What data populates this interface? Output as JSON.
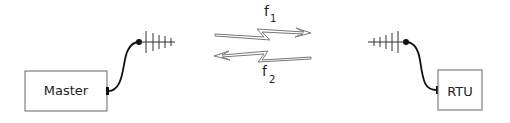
{
  "nodes": {
    "master": {
      "label": "Master"
    },
    "rtu": {
      "label": "RTU"
    }
  },
  "links": {
    "uplink": {
      "label": "f",
      "subscript": "1",
      "direction": "master-to-rtu"
    },
    "downlink": {
      "label": "f",
      "subscript": "2",
      "direction": "rtu-to-master"
    }
  },
  "colors": {
    "stroke": "#222222",
    "arrow": "#777777",
    "box": "#666666"
  }
}
